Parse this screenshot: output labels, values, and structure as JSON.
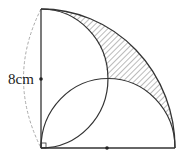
{
  "diagram": {
    "labels": {
      "side_length": "8cm"
    },
    "colors": {
      "stroke": "#333333",
      "dashed": "#aaaaaa",
      "hatch": "#555555",
      "background": "#ffffff"
    },
    "elements": [
      {
        "type": "quarter-circle",
        "description": "large quarter circle arc from top of left side to right end of base"
      },
      {
        "type": "semicircle",
        "description": "semicircle on vertical side, bulging right"
      },
      {
        "type": "semicircle",
        "description": "semicircle on horizontal base, bulging up"
      },
      {
        "type": "shaded-region",
        "description": "hatched region between quarter arc and the two semicircles"
      },
      {
        "type": "right-angle-mark",
        "description": "small square at bottom-left corner"
      },
      {
        "type": "midpoint-dot",
        "description": "dot at midpoint of vertical side"
      },
      {
        "type": "midpoint-dot",
        "description": "dot at midpoint of base"
      },
      {
        "type": "dashed-arc",
        "description": "dimension arc indicating the vertical side length"
      }
    ]
  }
}
